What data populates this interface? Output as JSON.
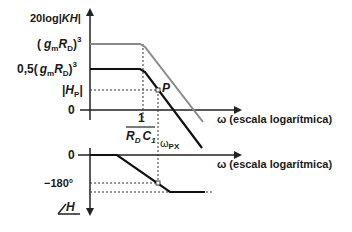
{
  "magnitude_plot": {
    "y_axis_label": "20log|KH|",
    "y_label_prefix": "20log",
    "y_label_var": "KH",
    "levels": {
      "high": {
        "label": "(g_m R_D)^3",
        "text_pre": "(",
        "gm": "g",
        "gm_sub": "m",
        "rd": "R",
        "rd_sub": "D",
        "text_post": ")",
        "exp": "3"
      },
      "low": {
        "label": "0,5(g_m R_D)^3",
        "coef": "0,5(",
        "gm": "g",
        "gm_sub": "m",
        "rd": "R",
        "rd_sub": "D",
        "text_post": ")",
        "exp": "3"
      },
      "hp": {
        "label": "|H_P|",
        "h": "H",
        "sub": "P"
      },
      "zero": "0"
    },
    "x_axis_label": "ω (escala logarítmica)",
    "corner_label": {
      "numerator": "1",
      "den_r": "R",
      "den_r_sub": "D",
      "den_c": "C",
      "den_c_sub": "1"
    },
    "point_label": "P",
    "crossover_label": {
      "main": "ω",
      "sub": "PX"
    },
    "colors": {
      "high_curve": "#8a8a8a",
      "low_curve": "#111111",
      "axis": "#222222",
      "dashed": "#333333"
    }
  },
  "phase_plot": {
    "y_axis_label": "∠H",
    "y_label_angle": "/",
    "y_label_var": "H",
    "levels": {
      "zero": "0",
      "minus180": "−180°"
    },
    "x_axis_label": "ω (escala logarítmica)"
  }
}
